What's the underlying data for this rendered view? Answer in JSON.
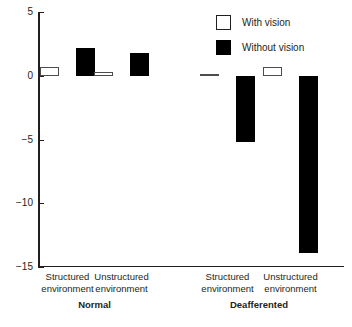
{
  "chart_data": {
    "type": "bar",
    "title": "",
    "subtitle": "",
    "xlabel": "",
    "ylabel": "",
    "ylim": [
      -15,
      5
    ],
    "yticks": [
      5,
      0,
      -5,
      -10,
      -15
    ],
    "ytick_labels": [
      "5",
      "0",
      "−5",
      "−10",
      "−15"
    ],
    "grid": false,
    "legend_position": "top-right",
    "categories": [
      "Structured environment",
      "Unstructured environment",
      "Structured environment",
      "Unstructured environment"
    ],
    "category_lines": [
      [
        "Structured",
        "environment"
      ],
      [
        "Unstructured",
        "environment"
      ],
      [
        "Structured",
        "environment"
      ],
      [
        "Unstructured",
        "environment"
      ]
    ],
    "groups": [
      {
        "label": "Normal",
        "category_indices": [
          0,
          1
        ]
      },
      {
        "label": "Deafferented",
        "category_indices": [
          2,
          3
        ]
      }
    ],
    "series": [
      {
        "name": "With vision",
        "color": "#ffffff",
        "edge_color": "#4d4d4d",
        "values": [
          0.65,
          0.3,
          0.1,
          0.65
        ]
      },
      {
        "name": "Without vision",
        "color": "#000000",
        "edge_color": "#000000",
        "values": [
          2.15,
          1.75,
          -5.2,
          -13.9
        ]
      }
    ]
  },
  "legend": {
    "items": [
      {
        "label": "With vision",
        "swatch": "white-square-icon"
      },
      {
        "label": "Without vision",
        "swatch": "black-square-icon"
      }
    ]
  },
  "axis": {
    "y_tick_labels": [
      "5",
      "0",
      "−5",
      "−10",
      "−15"
    ]
  }
}
